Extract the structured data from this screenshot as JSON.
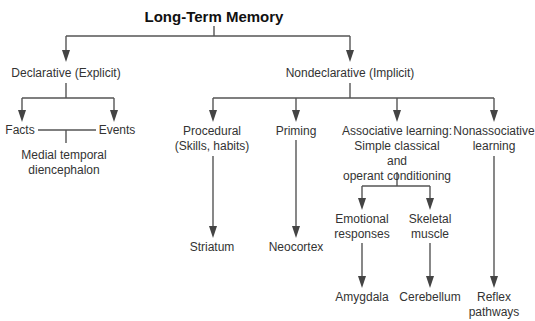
{
  "title": "Long-Term Memory",
  "declarative": {
    "label": "Declarative (Explicit)",
    "facts": "Facts",
    "events": "Events",
    "region_line1": "Medial temporal",
    "region_line2": "diencephalon"
  },
  "nondeclarative": {
    "label": "Nondeclarative (Implicit)",
    "procedural": {
      "line1": "Procedural",
      "line2": "(Skills, habits)",
      "region": "Striatum"
    },
    "priming": {
      "label": "Priming",
      "region": "Neocortex"
    },
    "associative": {
      "line1": "Associative learning:",
      "line2": "Simple classical",
      "line3": "and",
      "line4": "operant conditioning",
      "emotional": {
        "line1": "Emotional",
        "line2": "responses",
        "region": "Amygdala"
      },
      "skeletal": {
        "line1": "Skeletal",
        "line2": "muscle",
        "region": "Cerebellum"
      }
    },
    "nonassociative": {
      "line1": "Nonassociative",
      "line2": "learning",
      "region_line1": "Reflex",
      "region_line2": "pathways"
    }
  },
  "colors": {
    "line": "#555555",
    "text": "#333333"
  }
}
